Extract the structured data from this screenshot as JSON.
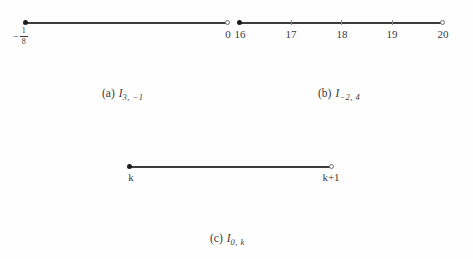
{
  "figure": {
    "background": "#fefefe",
    "line_color": "#3c3c3c",
    "closed_dot_color": "#1c1c1c",
    "open_circle_border_color": "#6f6f6f",
    "panels": {
      "a": {
        "caption_prefix": "(a)",
        "symbol": "I",
        "subscript": "3, −1",
        "left_label": {
          "sign": "−",
          "numerator": "1",
          "denominator": "8"
        },
        "right_label": "0",
        "left_endpoint": "closed",
        "right_endpoint": "open"
      },
      "b": {
        "caption_prefix": "(b)",
        "symbol": "I",
        "subscript": "−2, 4",
        "tick_labels": [
          "16",
          "17",
          "18",
          "19",
          "20"
        ],
        "left_endpoint": "closed",
        "right_endpoint": "open"
      },
      "c": {
        "caption_prefix": "(c)",
        "symbol": "I",
        "subscript": "0, k",
        "left_label": "k",
        "right_label": "k+1",
        "left_endpoint": "closed",
        "right_endpoint": "open"
      }
    }
  }
}
